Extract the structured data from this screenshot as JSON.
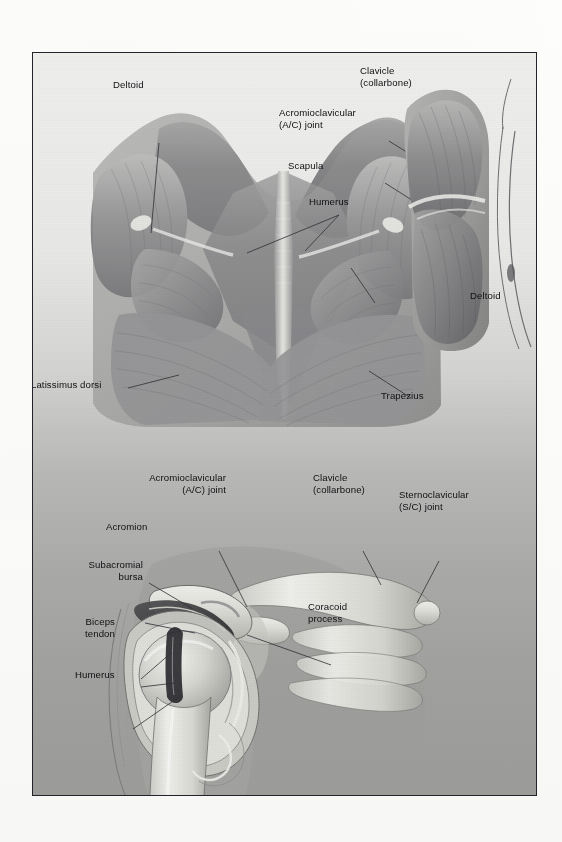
{
  "figure": {
    "domain": "anatomical-illustration",
    "title_visible": false,
    "frame": {
      "border_color": "#23242a",
      "background_top": "#f4f4f2",
      "background_bottom": "#9d9d9b"
    },
    "panels": [
      {
        "id": "posterior-back-view",
        "description": "Posterior view of upper back and shoulders showing superficial musculature"
      },
      {
        "id": "lateral-arm-view",
        "description": "Lateral view of shoulder and upper arm"
      },
      {
        "id": "shoulder-cross-section",
        "description": "Cutaway anterior view of shoulder joint showing bones, bursa and tendon"
      }
    ]
  },
  "labels": {
    "deltoid_left": "Deltoid",
    "clavicle_top": "Clavicle\n(collarbone)",
    "ac_joint_top": "Acromioclavicular\n(A/C) joint",
    "scapula": "Scapula",
    "humerus_top": "Humerus",
    "deltoid_right": "Deltoid",
    "latissimus_dorsi": "Latissimus dorsi",
    "trapezius": "Trapezius",
    "ac_joint_bottom": "Acromioclavicular\n(A/C) joint",
    "clavicle_bottom": "Clavicle\n(collarbone)",
    "sc_joint": "Sternoclavicular\n(S/C) joint",
    "acromion": "Acromion",
    "subacromial_bursa": "Subacromial\nbursa",
    "biceps_tendon": "Biceps\ntendon",
    "humerus_bottom": "Humerus",
    "coracoid_process": "Coracoid\nprocess"
  },
  "colors": {
    "label_text": "#101014",
    "leader_line": "#2a2a30",
    "muscle_dark": "#6f6f72",
    "muscle_mid": "#8e8e90",
    "muscle_light": "#c9c9c7",
    "bone_light": "#e9e9e6",
    "bone_shadow": "#9a9a98",
    "cartilage": "#f2f2ee",
    "cavity_dark": "#2d2d30"
  }
}
